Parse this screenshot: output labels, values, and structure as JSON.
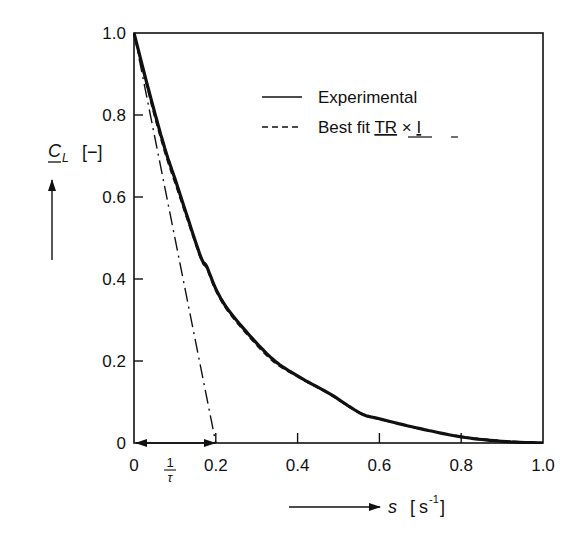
{
  "chart_data": {
    "type": "line",
    "title": "",
    "xlabel": "s",
    "xunit": "[s⁻¹]",
    "ylabel": "C_L",
    "yunit": "[−]",
    "xlim": [
      0,
      1.0
    ],
    "ylim": [
      0,
      1.0
    ],
    "grid": false,
    "legend_position": "upper right (inside)",
    "x_ticks": [
      "0",
      "0.2",
      "0.4",
      "0.6",
      "0.8",
      "1.0"
    ],
    "y_ticks": [
      "0",
      "0.2",
      "0.4",
      "0.6",
      "0.8",
      "1.0"
    ],
    "series": [
      {
        "name": "Experimental",
        "style": "solid",
        "x": [
          0,
          0.044,
          0.078,
          0.105,
          0.161,
          0.178,
          0.203,
          0.242,
          0.333,
          0.406,
          0.479,
          0.553,
          0.6,
          0.7,
          0.8,
          0.9,
          1.0
        ],
        "y": [
          1.0,
          0.83,
          0.71,
          0.63,
          0.46,
          0.43,
          0.37,
          0.31,
          0.21,
          0.16,
          0.12,
          0.073,
          0.059,
          0.035,
          0.015,
          0.004,
          0.0
        ]
      },
      {
        "name": "Best fit TR × I",
        "style": "dashed",
        "x": [
          0,
          0.044,
          0.078,
          0.105,
          0.161,
          0.178,
          0.203,
          0.242,
          0.333,
          0.406,
          0.479,
          0.553,
          0.6,
          0.7,
          0.8,
          0.9,
          1.0
        ],
        "y": [
          1.0,
          0.82,
          0.7,
          0.62,
          0.455,
          0.425,
          0.365,
          0.305,
          0.205,
          0.158,
          0.118,
          0.072,
          0.058,
          0.034,
          0.016,
          0.006,
          0.0
        ]
      },
      {
        "name": "Initial slope tangent",
        "style": "dash-dot",
        "x": [
          0,
          0.2
        ],
        "y": [
          1.0,
          0.0
        ]
      }
    ],
    "annotations": [
      {
        "text": "1/τ",
        "description": "double arrow from s=0 to s=0.2 along x-axis"
      }
    ]
  },
  "legend": {
    "items": [
      {
        "label": "Experimental",
        "style": "solid"
      },
      {
        "label_prefix": "Best fit ",
        "label_tr": "TR",
        "label_times": " × ",
        "label_i": "I",
        "style": "dashed"
      }
    ]
  },
  "axes": {
    "y_label_main": "C",
    "y_label_sub": "L",
    "y_label_unit": "[−]",
    "x_label_main": "s",
    "x_label_unit_base": "s",
    "x_label_unit_exp": "-1",
    "tau_numerator": "1",
    "tau_denominator": "τ"
  }
}
